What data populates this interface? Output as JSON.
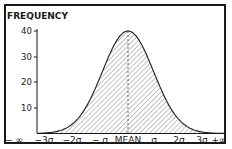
{
  "chart_data": {
    "type": "area",
    "title": "",
    "ylabel": "FREQUENCY",
    "xlabel": "",
    "ylim": [
      0,
      40
    ],
    "yticks": [
      10,
      20,
      30,
      40
    ],
    "xtick_labels": [
      "− ∞",
      "−3σ",
      "−2σ",
      "− σ",
      "MEAN",
      "σ",
      "2σ",
      "3σ",
      "+∞"
    ],
    "x": [
      -3,
      -2,
      -1,
      0,
      1,
      2,
      3
    ],
    "values": [
      0.4,
      5.4,
      24.3,
      40,
      24.3,
      5.4,
      0.4
    ],
    "series": [
      {
        "name": "Normal distribution",
        "fill": "hatched",
        "peak": 40
      }
    ],
    "annotations": [
      "dashed vertical line at MEAN"
    ],
    "grid": false,
    "legend": null
  },
  "labels": {
    "ylabel": "FREQUENCY",
    "y40": "40",
    "y30": "30",
    "y20": "20",
    "y10": "10",
    "x0": "− ∞",
    "x1": "−3σ",
    "x2": "−2σ",
    "x3": "− σ",
    "x4": "MEAN",
    "x5": "σ",
    "x6": "2σ",
    "x7": "3σ",
    "x8": "+∞"
  }
}
